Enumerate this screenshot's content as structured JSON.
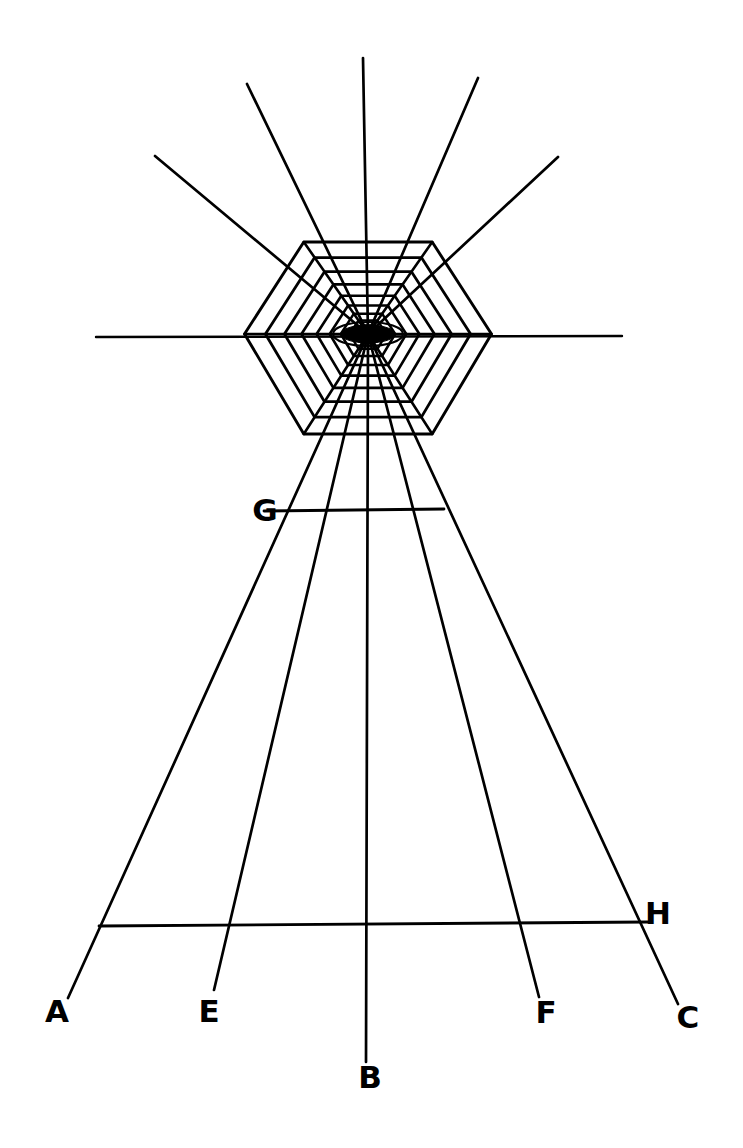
{
  "figure": {
    "background_color": "#ffffff",
    "ink_color": "#000000",
    "canvas": {
      "width": 743,
      "height": 1148
    },
    "labels": [
      {
        "id": "A",
        "text": "A",
        "x": 57,
        "y": 1022,
        "role": "ray-endpoint-label"
      },
      {
        "id": "E",
        "text": "E",
        "x": 209,
        "y": 1022,
        "role": "ray-endpoint-label"
      },
      {
        "id": "B",
        "text": "B",
        "x": 370,
        "y": 1088,
        "role": "ray-endpoint-label"
      },
      {
        "id": "F",
        "text": "F",
        "x": 546,
        "y": 1023,
        "role": "ray-endpoint-label"
      },
      {
        "id": "C",
        "text": "C",
        "x": 688,
        "y": 1028,
        "role": "ray-endpoint-label"
      },
      {
        "id": "G",
        "text": "G",
        "x": 265,
        "y": 521,
        "role": "transversal-left-label"
      },
      {
        "id": "H",
        "text": "H",
        "x": 658,
        "y": 924,
        "role": "transversal-right-label"
      }
    ],
    "center": {
      "name": "vanishing-point",
      "x": 368,
      "y": 334,
      "hub_fill": "#000000",
      "hub_rx": 27,
      "hub_ry": 9,
      "ring_rx": 35,
      "ring_ry": 12
    },
    "horizon_line": {
      "x1": 96,
      "y1": 337,
      "x2": 622,
      "y2": 336
    },
    "transversal_lines": [
      {
        "name": "transversal-G",
        "x1": 264,
        "y1": 511,
        "x2": 444,
        "y2": 509
      },
      {
        "name": "transversal-H",
        "x1": 99,
        "y1": 926,
        "x2": 648,
        "y2": 922
      }
    ],
    "upper_rays": [
      {
        "name": "upper-ray-far-left",
        "x2": 155,
        "y2": 156
      },
      {
        "name": "upper-ray-left",
        "x2": 247,
        "y2": 84
      },
      {
        "name": "upper-ray-center",
        "x2": 363,
        "y2": 58
      },
      {
        "name": "upper-ray-right",
        "x2": 478,
        "y2": 78
      },
      {
        "name": "upper-ray-far-right",
        "x2": 558,
        "y2": 157
      }
    ],
    "lower_rays": [
      {
        "name": "ray-to-A",
        "label": "A",
        "x2": 68,
        "y2": 998
      },
      {
        "name": "ray-to-E",
        "label": "E",
        "x2": 214,
        "y2": 990
      },
      {
        "name": "ray-to-B",
        "label": "B",
        "x2": 366,
        "y2": 1062
      },
      {
        "name": "ray-to-F",
        "label": "F",
        "x2": 539,
        "y2": 997
      },
      {
        "name": "ray-to-C",
        "label": "C",
        "x2": 678,
        "y2": 1004
      }
    ],
    "web": {
      "name": "concentric-web",
      "ring_count": 11,
      "upper_outer_y": 242,
      "lower_outer_y": 434,
      "left_outer_x": 247,
      "right_outer_x": 494,
      "shape": "nested hexagonal rings converging on the vanishing point"
    }
  }
}
